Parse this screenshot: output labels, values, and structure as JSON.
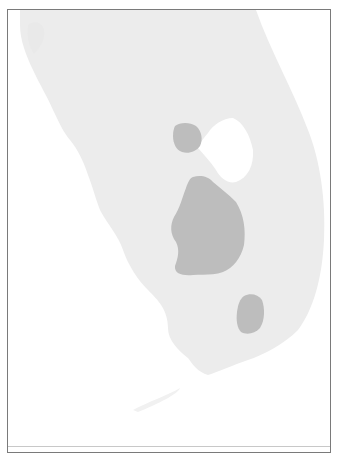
{
  "map": {
    "region": "South Florida",
    "colors": {
      "background": "#ffffff",
      "land": "#ececec",
      "land_shade": "#e6e6e6",
      "highlight_area": "#bdbdbd",
      "lake": "#ffffff",
      "frame": "#7a7a7a",
      "rule": "#c8c8c8"
    },
    "features": [
      {
        "name": "land-mass",
        "type": "land"
      },
      {
        "name": "lake",
        "type": "water",
        "label": "Lake Okeechobee"
      },
      {
        "name": "highlight-area-north",
        "type": "shaded-region"
      },
      {
        "name": "highlight-area-central",
        "type": "shaded-region"
      },
      {
        "name": "highlight-area-southeast",
        "type": "shaded-region"
      }
    ]
  }
}
